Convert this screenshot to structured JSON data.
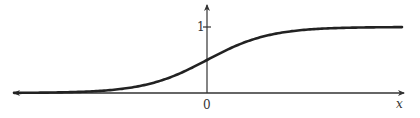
{
  "chart_data": {
    "type": "line",
    "title": "",
    "xlabel": "x",
    "ylabel": "",
    "x_tick_labels": [
      "0"
    ],
    "y_tick_labels": [
      "1"
    ],
    "grid": false,
    "legend": null,
    "function": "logistic sigmoid 1/(1+e^(-x))",
    "xlim": [
      -6,
      6
    ],
    "ylim": [
      0,
      1.35
    ],
    "series": [
      {
        "name": "sigmoid",
        "x": [
          -6,
          -5,
          -4,
          -3,
          -2,
          -1,
          0,
          1,
          2,
          3,
          4,
          5,
          6
        ],
        "y": [
          0.0025,
          0.0067,
          0.018,
          0.047,
          0.119,
          0.269,
          0.5,
          0.731,
          0.881,
          0.953,
          0.982,
          0.993,
          0.9975
        ]
      }
    ],
    "colors": {
      "axis": "#333333",
      "curve": "#222222"
    }
  },
  "labels": {
    "x_axis": "x",
    "origin": "0",
    "y_tick_one": "1"
  }
}
